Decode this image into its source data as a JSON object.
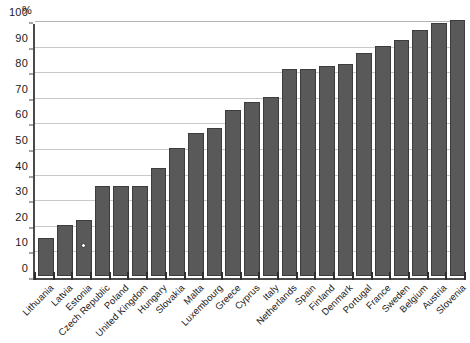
{
  "chart_data": {
    "type": "bar",
    "title": "",
    "subtitle": "",
    "xlabel": "",
    "ylabel": "%",
    "ylim": [
      0,
      100
    ],
    "yticks": [
      0,
      10,
      20,
      30,
      40,
      50,
      60,
      70,
      80,
      90,
      100
    ],
    "grid": true,
    "legend": false,
    "bar_color": "#595959",
    "categories": [
      "Lithuania",
      "Latvia",
      "Estonia",
      "Czech Republic",
      "Poland",
      "United Kingdom",
      "Hungary",
      "Slovakia",
      "Malta",
      "Luxembourg",
      "Greece",
      "Cyprus",
      "Italy",
      "Netherlands",
      "Spain",
      "Finland",
      "Denmark",
      "Portugal",
      "France",
      "Sweden",
      "Belgium",
      "Austria",
      "Slovenia"
    ],
    "values": [
      15,
      20,
      22,
      35,
      35,
      35,
      42,
      50,
      56,
      58,
      65,
      68,
      70,
      81,
      81,
      82,
      83,
      87,
      90,
      92,
      96,
      99,
      100
    ],
    "annotations": [
      {
        "category": "Estonia",
        "value": 12,
        "marker": "open-circle",
        "note": "small open circle marker plotted inside the Estonia bar"
      }
    ]
  }
}
